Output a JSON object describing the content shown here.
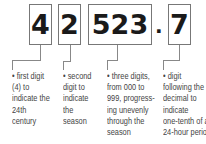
{
  "diagram": {
    "segments": [
      {
        "digits": "4",
        "description": [
          "• first digit",
          "(4) to",
          "indicate the",
          "24th",
          "century"
        ]
      },
      {
        "digits": "2",
        "description": [
          "•  second",
          "digit to",
          "indicate",
          "the",
          "season"
        ]
      },
      {
        "digits": "523",
        "description": [
          "• three digits,",
          "from 000 to",
          "999, progress-",
          "ing unevenly",
          "through the",
          "season"
        ]
      },
      {
        "digits": "7",
        "description": [
          "• digit",
          "following the",
          "decimal to",
          "indicate",
          "one-tenth of a",
          "24-hour period"
        ]
      }
    ],
    "decimal_point": "."
  }
}
